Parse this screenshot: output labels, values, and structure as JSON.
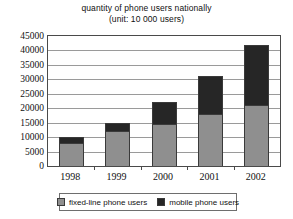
{
  "chart_data": {
    "type": "bar",
    "subtype": "stacked-vertical",
    "title": "quantity of phone users nationally",
    "subtitle": "(unit: 10 000 users)",
    "xlabel": "",
    "ylabel": "",
    "categories": [
      "1998",
      "1999",
      "2000",
      "2001",
      "2002"
    ],
    "series": [
      {
        "name": "fixed-line phone users",
        "color": "#8f8f8f",
        "values": [
          7800,
          12000,
          14500,
          18000,
          21000
        ]
      },
      {
        "name": "mobile phone users",
        "color": "#262626",
        "values": [
          2200,
          3000,
          7500,
          13000,
          21000
        ]
      }
    ],
    "totals": [
      10000,
      15000,
      22000,
      31000,
      42000
    ],
    "ylim": [
      0,
      45000
    ],
    "ytick_step": 5000,
    "yticks": [
      "0",
      "5000",
      "10000",
      "15000",
      "20000",
      "25000",
      "30000",
      "35000",
      "40000",
      "45000"
    ],
    "grid": true,
    "legend_position": "bottom",
    "legend": [
      "fixed-line phone users",
      "mobile phone users"
    ]
  },
  "colors": {
    "fixed_line": "#8f8f8f",
    "mobile": "#262626",
    "axis": "#4a4a4a",
    "gridline": "#9a9a9a",
    "background": "#ffffff",
    "text": "#111111"
  }
}
